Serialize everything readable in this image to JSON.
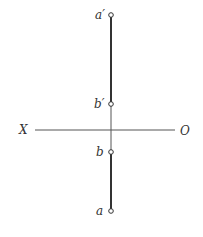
{
  "diagram": {
    "type": "orthographic projection of a line segment",
    "axis": {
      "left_label": "X",
      "right_label": "O"
    },
    "points": [
      {
        "id": "a_prime",
        "label": "a′",
        "view": "front"
      },
      {
        "id": "b_prime",
        "label": "b′",
        "view": "front"
      },
      {
        "id": "b",
        "label": "b",
        "view": "top"
      },
      {
        "id": "a",
        "label": "a",
        "view": "top"
      }
    ],
    "segments": [
      {
        "from": "a_prime",
        "to": "b_prime",
        "style": "thick"
      },
      {
        "from": "b_prime",
        "to": "b",
        "style": "thin projection line"
      },
      {
        "from": "b",
        "to": "a",
        "style": "thick"
      }
    ],
    "colors": {
      "line": "#333333",
      "background": "#ffffff"
    }
  }
}
